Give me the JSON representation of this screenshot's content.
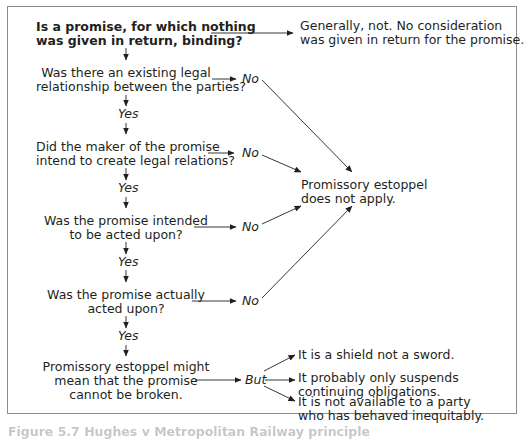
{
  "diagram": {
    "type": "flowchart",
    "start": {
      "line1": "Is a promise, for which nothing",
      "line2": "was given in return, binding?"
    },
    "start_outcome": {
      "line1": "Generally, not. No consideration",
      "line2": "was given in return for the promise."
    },
    "questions": [
      {
        "line1": "Was there an existing legal",
        "line2": "relationship between the parties?",
        "no_label": "No",
        "yes_label": "Yes"
      },
      {
        "line1": "Did the maker of the promise",
        "line2": "intend to create legal relations?",
        "no_label": "No",
        "yes_label": "Yes"
      },
      {
        "line1": "Was the promise intended",
        "line2": "to be acted upon?",
        "no_label": "No",
        "yes_label": "Yes"
      },
      {
        "line1": "Was the promise actually",
        "line2": "acted upon?",
        "no_label": "No",
        "yes_label": "Yes"
      }
    ],
    "no_outcome": {
      "line1": "Promissory estoppel",
      "line2": "does not apply."
    },
    "final": {
      "line1": "Promissory estoppel might",
      "line2": "mean that the promise",
      "line3": "cannot be broken.",
      "but_label": "But"
    },
    "caveats": [
      {
        "line1": "It is a shield not a sword.",
        "line2": ""
      },
      {
        "line1": "It probably only suspends",
        "line2": "continuing obligations."
      },
      {
        "line1": "It is not available to a party",
        "line2": "who has behaved inequitably."
      }
    ]
  },
  "caption": "Figure 5.7  Hughes v Metropolitan Railway principle",
  "colors": {
    "text": "#231f20",
    "frame": "#8c8c8c",
    "lines": "#231f20"
  }
}
